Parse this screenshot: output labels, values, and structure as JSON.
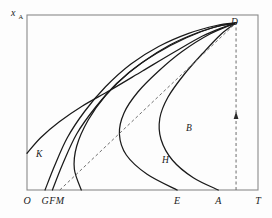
{
  "figure": {
    "kind": "line-diagram",
    "background_color": "#fdfdfd",
    "frame_color": "#808080",
    "curve_color": "#1a1a1a",
    "dash_color": "#6e6e6e"
  },
  "axes": {
    "y_label_main": "x",
    "y_label_sub": "A",
    "x_ticks": [
      {
        "label": "O",
        "x": 0
      },
      {
        "label": "G",
        "x": 78
      },
      {
        "label": "F",
        "x": 110
      },
      {
        "label": "M",
        "x": 142
      },
      {
        "label": "E",
        "x": 650
      },
      {
        "label": "A",
        "x": 828
      },
      {
        "label": "T",
        "x": 1000
      }
    ]
  },
  "curve_labels": [
    {
      "label": "K",
      "x": 36,
      "y": 157
    },
    {
      "label": "H",
      "x": 162,
      "y": 163
    },
    {
      "label": "B",
      "x": 186,
      "y": 131
    },
    {
      "label": "D",
      "x": 231,
      "y": 25
    }
  ],
  "chart_data": {
    "type": "line",
    "title": "",
    "xlabel": "",
    "ylabel": "x_A",
    "xlim": [
      0,
      1000
    ],
    "ylim": [
      0,
      1000
    ],
    "grid": false,
    "legend": "none",
    "convergence_point": {
      "name": "D",
      "x": 905,
      "y": 955
    },
    "annotations": [
      {
        "name": "vertical-dashed-line-at-A",
        "x": 905,
        "y0": 0,
        "y1": 955,
        "style": "dashed",
        "arrow": "up"
      },
      {
        "name": "diagonal-dashed-line-M-to-D",
        "x0": 142,
        "y0": 0,
        "x1": 905,
        "y1": 955,
        "style": "dashed"
      }
    ],
    "series": [
      {
        "name": "K",
        "label": "K",
        "style": "solid",
        "points": [
          [
            0,
            210
          ],
          [
            60,
            300
          ],
          [
            140,
            390
          ],
          [
            240,
            480
          ],
          [
            360,
            570
          ],
          [
            500,
            680
          ],
          [
            640,
            790
          ],
          [
            760,
            880
          ],
          [
            850,
            930
          ],
          [
            905,
            955
          ]
        ]
      },
      {
        "name": "curve-G",
        "label": "",
        "style": "solid",
        "points": [
          [
            78,
            0
          ],
          [
            120,
            140
          ],
          [
            175,
            300
          ],
          [
            250,
            450
          ],
          [
            340,
            590
          ],
          [
            450,
            720
          ],
          [
            570,
            820
          ],
          [
            700,
            895
          ],
          [
            820,
            940
          ],
          [
            905,
            955
          ]
        ]
      },
      {
        "name": "curve-F",
        "label": "",
        "style": "solid",
        "points": [
          [
            110,
            0
          ],
          [
            155,
            150
          ],
          [
            215,
            320
          ],
          [
            295,
            470
          ],
          [
            390,
            610
          ],
          [
            500,
            730
          ],
          [
            620,
            830
          ],
          [
            740,
            900
          ],
          [
            840,
            940
          ],
          [
            905,
            955
          ]
        ]
      },
      {
        "name": "curve-H",
        "label": "H",
        "style": "solid",
        "points": [
          [
            235,
            0
          ],
          [
            205,
            120
          ],
          [
            215,
            250
          ],
          [
            265,
            400
          ],
          [
            340,
            540
          ],
          [
            440,
            670
          ],
          [
            560,
            780
          ],
          [
            690,
            870
          ],
          [
            810,
            930
          ],
          [
            905,
            955
          ]
        ]
      },
      {
        "name": "curve-B",
        "label": "B",
        "style": "solid",
        "points": [
          [
            650,
            0
          ],
          [
            520,
            90
          ],
          [
            430,
            200
          ],
          [
            400,
            320
          ],
          [
            420,
            440
          ],
          [
            480,
            560
          ],
          [
            570,
            680
          ],
          [
            670,
            790
          ],
          [
            790,
            890
          ],
          [
            905,
            955
          ]
        ]
      },
      {
        "name": "curve-A",
        "label": "",
        "style": "solid",
        "points": [
          [
            828,
            0
          ],
          [
            720,
            70
          ],
          [
            630,
            170
          ],
          [
            580,
            290
          ],
          [
            575,
            410
          ],
          [
            610,
            530
          ],
          [
            680,
            660
          ],
          [
            760,
            780
          ],
          [
            840,
            890
          ],
          [
            905,
            955
          ]
        ]
      }
    ]
  }
}
